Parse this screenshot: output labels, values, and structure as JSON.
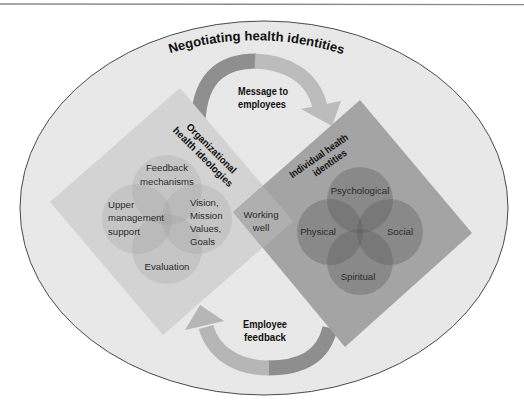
{
  "diagram": {
    "title": "Negotiating health identities",
    "message_arrow": {
      "lines": [
        "Message to",
        "employees"
      ]
    },
    "feedback_arrow": {
      "lines": [
        "Employee",
        "feedback"
      ]
    },
    "organizational": {
      "title_lines": [
        "Organizational",
        "health ideologies"
      ],
      "circles": [
        {
          "id": "feedback",
          "lines": [
            "Feedback",
            "mechanisms"
          ]
        },
        {
          "id": "upper-management",
          "lines": [
            "Upper",
            "management",
            "support"
          ]
        },
        {
          "id": "vision",
          "lines": [
            "Vision,",
            "Mission",
            "Values,",
            "Goals"
          ]
        },
        {
          "id": "evaluation",
          "lines": [
            "Evaluation"
          ]
        }
      ]
    },
    "individual": {
      "title_lines": [
        "Individual health",
        "identities"
      ],
      "circles": [
        {
          "id": "psychological",
          "label": "Psychological"
        },
        {
          "id": "physical",
          "label": "Physical"
        },
        {
          "id": "social",
          "label": "Social"
        },
        {
          "id": "spiritual",
          "label": "Spiritual"
        }
      ]
    },
    "overlap": {
      "lines": [
        "Working",
        "well"
      ]
    }
  },
  "colors": {
    "ellipse_fill": "#e8e8e8",
    "ellipse_stroke": "#4a4a4a",
    "organizational_diamond": "#d3d3d3",
    "individual_diamond": "#a4a4a4",
    "overlap": "#afafaf",
    "arrow_dark": "#8e8e8e",
    "arrow_light": "#bdbdbd"
  }
}
